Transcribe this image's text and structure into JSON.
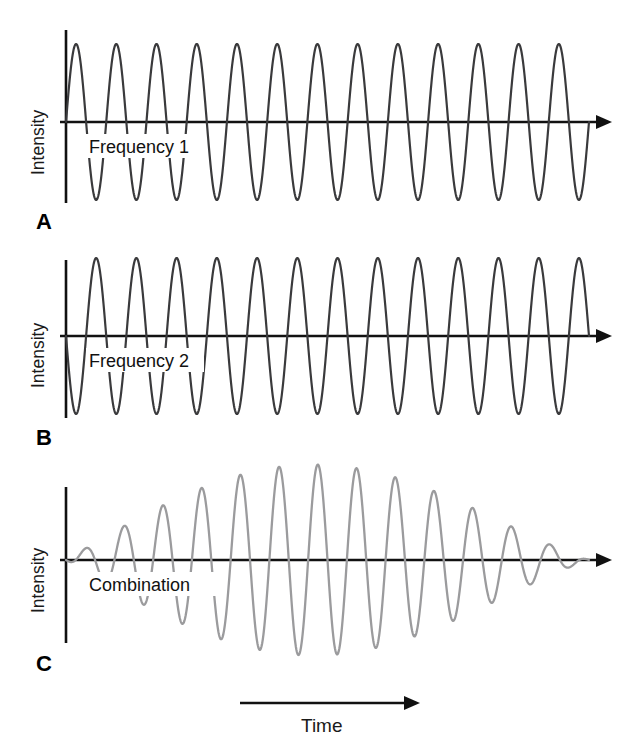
{
  "figure": {
    "background_color": "#ffffff",
    "axis_color": "#111111",
    "wave_color_dark": "#3a3a3c",
    "wave_color_light": "#9b9b9d"
  },
  "panels": [
    {
      "letter": "A",
      "y_axis_label": "Intensity",
      "inline_label": "Frequency 1",
      "wave_style": "dark",
      "cycles": 13,
      "start_phase": "positive",
      "amplitude": 78
    },
    {
      "letter": "B",
      "y_axis_label": "Intensity",
      "inline_label": "Frequency 2",
      "wave_style": "dark",
      "cycles": 13,
      "start_phase": "negative",
      "amplitude": 78
    },
    {
      "letter": "C",
      "y_axis_label": "Intensity",
      "inline_label": "Combination",
      "wave_style": "light",
      "cycles": 14,
      "start_phase": "positive",
      "amplitude": 95
    }
  ],
  "time_axis": {
    "label": "Time",
    "arrow_direction": "right"
  },
  "icons": {
    "axis_arrow": "arrow-right-icon",
    "time_arrow": "arrow-right-icon"
  },
  "chart_data": {
    "type": "line",
    "xlabel": "Time",
    "ylabel": "Intensity",
    "grid": false,
    "legend": "none",
    "xlim": [
      0,
      1
    ],
    "ylim": [
      -1.25,
      1.25
    ],
    "annotations": [
      "Frequency 1",
      "Frequency 2",
      "Combination",
      "A",
      "B",
      "C"
    ],
    "series": [
      {
        "name": "Frequency 1",
        "panel": "A",
        "waveform": "sine",
        "cycles": 13,
        "phase_deg": 0,
        "amplitude": 1.0,
        "color": "#3a3a3c"
      },
      {
        "name": "Frequency 2",
        "panel": "B",
        "waveform": "sine",
        "cycles": 13,
        "phase_deg": 180,
        "amplitude": 1.0,
        "color": "#3a3a3c"
      },
      {
        "name": "Combination",
        "panel": "C",
        "waveform": "beat-sum",
        "cycles": 14,
        "beat_nodes": 2,
        "amplitude": 1.2,
        "color": "#9b9b9d",
        "description": "Sum of Frequency 1 and Frequency 2 producing amplitude-modulated beats with nodes of near-zero amplitude"
      }
    ]
  }
}
